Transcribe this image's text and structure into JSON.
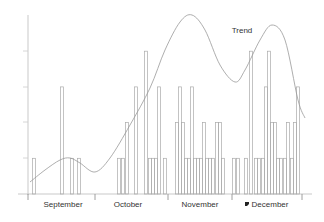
{
  "chart_data": {
    "type": "bar",
    "title": "",
    "xlabel": "",
    "ylabel": "",
    "ylim": [
      0,
      5
    ],
    "grid": false,
    "legend": null,
    "categories": [
      "September",
      "October",
      "November",
      "December"
    ],
    "annotations": [
      {
        "text": "Trend",
        "x": 242,
        "y": 33
      }
    ],
    "series": [
      {
        "name": "Daily counts",
        "type": "bar",
        "points": [
          {
            "x": 34,
            "value": 1
          },
          {
            "x": 62,
            "value": 3
          },
          {
            "x": 72,
            "value": 1
          },
          {
            "x": 79,
            "value": 1
          },
          {
            "x": 119,
            "value": 1
          },
          {
            "x": 123,
            "value": 1
          },
          {
            "x": 127,
            "value": 2
          },
          {
            "x": 136,
            "value": 3
          },
          {
            "x": 146,
            "value": 4
          },
          {
            "x": 150,
            "value": 1
          },
          {
            "x": 153,
            "value": 1
          },
          {
            "x": 156,
            "value": 1
          },
          {
            "x": 159,
            "value": 3
          },
          {
            "x": 165,
            "value": 1
          },
          {
            "x": 177,
            "value": 2
          },
          {
            "x": 180,
            "value": 3
          },
          {
            "x": 183,
            "value": 2
          },
          {
            "x": 186,
            "value": 1
          },
          {
            "x": 189,
            "value": 1
          },
          {
            "x": 192,
            "value": 3
          },
          {
            "x": 195,
            "value": 1
          },
          {
            "x": 198,
            "value": 1
          },
          {
            "x": 201,
            "value": 1
          },
          {
            "x": 204,
            "value": 2
          },
          {
            "x": 207,
            "value": 1
          },
          {
            "x": 210,
            "value": 1
          },
          {
            "x": 213,
            "value": 1
          },
          {
            "x": 217,
            "value": 2
          },
          {
            "x": 220,
            "value": 2
          },
          {
            "x": 223,
            "value": 1
          },
          {
            "x": 234,
            "value": 1
          },
          {
            "x": 238,
            "value": 1
          },
          {
            "x": 246,
            "value": 1
          },
          {
            "x": 251,
            "value": 4
          },
          {
            "x": 256,
            "value": 1
          },
          {
            "x": 259,
            "value": 1
          },
          {
            "x": 263,
            "value": 1
          },
          {
            "x": 266,
            "value": 3
          },
          {
            "x": 269,
            "value": 4
          },
          {
            "x": 272,
            "value": 2
          },
          {
            "x": 275,
            "value": 2
          },
          {
            "x": 278,
            "value": 1
          },
          {
            "x": 281,
            "value": 1
          },
          {
            "x": 285,
            "value": 1
          },
          {
            "x": 288,
            "value": 2
          },
          {
            "x": 292,
            "value": 1
          },
          {
            "x": 295,
            "value": 2
          },
          {
            "x": 298,
            "value": 3
          }
        ]
      },
      {
        "name": "Trend",
        "type": "line",
        "smooth": true,
        "points": [
          [
            30,
            182
          ],
          [
            45,
            170
          ],
          [
            60,
            160
          ],
          [
            70,
            158
          ],
          [
            80,
            163
          ],
          [
            95,
            172
          ],
          [
            110,
            158
          ],
          [
            130,
            125
          ],
          [
            150,
            88
          ],
          [
            165,
            50
          ],
          [
            180,
            22
          ],
          [
            192,
            15
          ],
          [
            205,
            30
          ],
          [
            220,
            65
          ],
          [
            235,
            82
          ],
          [
            245,
            70
          ],
          [
            260,
            40
          ],
          [
            272,
            25
          ],
          [
            285,
            40
          ],
          [
            298,
            100
          ],
          [
            305,
            118
          ]
        ]
      }
    ],
    "axes": {
      "x_axis_y": 194,
      "y_axis_x": 28,
      "y_level_px": 35.7,
      "month_ticks_x": [
        28,
        95,
        168,
        232,
        302
      ],
      "y_ticks_y": [
        158,
        122,
        87,
        51
      ]
    }
  }
}
